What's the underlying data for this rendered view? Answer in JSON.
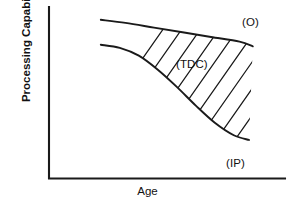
{
  "chart_data": {
    "type": "line",
    "title": "",
    "xlabel": "Age",
    "ylabel": "Processing Capability",
    "grid": false,
    "legend_position": "inline-annotations",
    "axis_ticks": {
      "x": [],
      "y": []
    },
    "xlim": [
      0,
      100
    ],
    "ylim": [
      0,
      100
    ],
    "shaded_region": {
      "label": "(TDC)",
      "description": "Hatched band between the optimal and impaired trajectories",
      "hatch_angle_deg": 55,
      "hatch_count": 16
    },
    "series": [
      {
        "name": "(O)",
        "label": "(O)",
        "description": "Optimal processing capability trajectory",
        "points": [
          {
            "x": 12,
            "y": 95
          },
          {
            "x": 25,
            "y": 93
          },
          {
            "x": 40,
            "y": 90
          },
          {
            "x": 55,
            "y": 87
          },
          {
            "x": 70,
            "y": 84
          },
          {
            "x": 85,
            "y": 81
          },
          {
            "x": 92,
            "y": 78
          }
        ]
      },
      {
        "name": "(IP)",
        "label": "(IP)",
        "description": "Impaired processing capability trajectory",
        "points": [
          {
            "x": 12,
            "y": 79
          },
          {
            "x": 22,
            "y": 77
          },
          {
            "x": 32,
            "y": 72
          },
          {
            "x": 42,
            "y": 63
          },
          {
            "x": 52,
            "y": 52
          },
          {
            "x": 62,
            "y": 40
          },
          {
            "x": 72,
            "y": 29
          },
          {
            "x": 82,
            "y": 21
          },
          {
            "x": 90,
            "y": 18
          }
        ]
      }
    ],
    "annotations": [
      {
        "id": "optimal",
        "text": "(O)"
      },
      {
        "id": "typical-decline-corridor",
        "text": "(TDC)"
      },
      {
        "id": "impaired",
        "text": "(IP)"
      }
    ]
  },
  "axes": {
    "y_label": "Processing Capability",
    "x_label": "Age"
  },
  "labels": {
    "optimal": "(O)",
    "tdc": "(TDC)",
    "impaired": "(IP)"
  },
  "colors": {
    "ink": "#1a1a1a",
    "background": "#ffffff"
  }
}
